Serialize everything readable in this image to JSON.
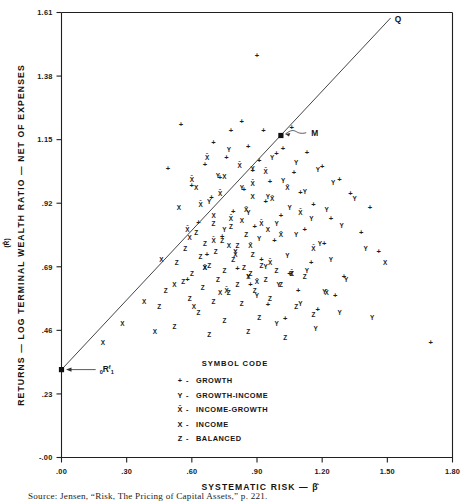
{
  "chart_data": {
    "type": "scatter",
    "title": "",
    "xlabel": "SYSTEMATIC RISK — β̂",
    "ylabel": "RETURNS — LOG TERMINAL WEALTH RATIO — NET OF EXPENSES",
    "ylabel_symbol": "(R̂)",
    "xlim": [
      0.0,
      1.8
    ],
    "ylim": [
      -0.0,
      1.61
    ],
    "xticks": [
      ".00",
      ".30",
      ".60",
      ".90",
      "1.20",
      "1.50",
      "1.80"
    ],
    "xtick_values": [
      0.0,
      0.3,
      0.6,
      0.9,
      1.2,
      1.5,
      1.8
    ],
    "yticks": [
      "1.61",
      "1.38",
      "1.15",
      ".92",
      ".69",
      ".46",
      ".23",
      "-.00"
    ],
    "ytick_values": [
      1.61,
      1.38,
      1.15,
      0.92,
      0.69,
      0.46,
      0.23,
      0.0
    ],
    "grid": false,
    "legend_position": "inside-bottom-center",
    "source": "Source: Jensen, “Risk, The Pricing of Capital Assets,” p. 221.",
    "annotations": [
      {
        "name": "Q",
        "label": "Q",
        "x": 1.52,
        "y": 1.585
      },
      {
        "name": "M",
        "label": "M",
        "x": 1.145,
        "y": 1.175
      },
      {
        "name": "Rf",
        "label": "₀Rᶠ₁",
        "x": 0.185,
        "y": 0.322
      }
    ],
    "line": {
      "name": "market-line",
      "x0": 0.0,
      "y0": 0.318,
      "x1": 1.515,
      "y1": 1.59
    },
    "markers": [
      {
        "name": "risk-free-point",
        "x": 0.0,
        "y": 0.318,
        "shape": "filled-square"
      },
      {
        "name": "market-point",
        "x": 1.01,
        "y": 1.165,
        "shape": "filled-square"
      }
    ],
    "legend": {
      "title": "SYMBOL CODE",
      "entries": [
        {
          "glyph": "+",
          "label": "GROWTH"
        },
        {
          "glyph": "Y",
          "label": "GROWTH-INCOME"
        },
        {
          "glyph": "X̄",
          "label": "INCOME-GROWTH"
        },
        {
          "glyph": "X",
          "label": "INCOME"
        },
        {
          "glyph": "Z",
          "label": "BALANCED"
        }
      ]
    },
    "series": [
      {
        "name": "GROWTH",
        "glyph": "+",
        "points": [
          [
            0.9,
            1.455
          ],
          [
            0.83,
            1.215
          ],
          [
            0.78,
            1.185
          ],
          [
            0.93,
            1.185
          ],
          [
            1.06,
            1.195
          ],
          [
            0.7,
            1.14
          ],
          [
            0.86,
            1.125
          ],
          [
            1.02,
            1.12
          ],
          [
            0.99,
            1.1
          ],
          [
            1.13,
            1.105
          ],
          [
            0.76,
            1.085
          ],
          [
            0.91,
            1.075
          ],
          [
            0.66,
            1.06
          ],
          [
            1.2,
            1.055
          ],
          [
            0.88,
            1.04
          ],
          [
            1.07,
            1.03
          ],
          [
            0.73,
            1.015
          ],
          [
            0.96,
            1.0
          ],
          [
            1.28,
            1.005
          ],
          [
            0.6,
            0.985
          ],
          [
            0.84,
            0.97
          ],
          [
            1.1,
            0.96
          ],
          [
            1.33,
            0.955
          ],
          [
            0.69,
            0.94
          ],
          [
            0.94,
            0.925
          ],
          [
            1.16,
            0.915
          ],
          [
            1.42,
            0.905
          ],
          [
            0.79,
            0.89
          ],
          [
            1.01,
            0.875
          ],
          [
            1.24,
            0.865
          ],
          [
            0.63,
            0.85
          ],
          [
            0.89,
            0.835
          ],
          [
            1.12,
            0.825
          ],
          [
            1.38,
            0.815
          ],
          [
            0.74,
            0.8
          ],
          [
            0.98,
            0.785
          ],
          [
            1.21,
            0.775
          ],
          [
            1.46,
            0.745
          ],
          [
            0.67,
            0.735
          ],
          [
            0.92,
            0.715
          ],
          [
            1.15,
            0.705
          ],
          [
            0.81,
            0.685
          ],
          [
            1.05,
            0.665
          ],
          [
            1.3,
            0.655
          ],
          [
            0.58,
            0.645
          ],
          [
            0.87,
            0.625
          ],
          [
            1.09,
            0.605
          ],
          [
            1.26,
            0.585
          ],
          [
            0.95,
            0.555
          ],
          [
            1.18,
            0.535
          ],
          [
            1.03,
            0.505
          ],
          [
            1.7,
            0.415
          ],
          [
            0.55,
            1.205
          ],
          [
            0.49,
            1.045
          ]
        ]
      },
      {
        "name": "GROWTH-INCOME",
        "glyph": "Y",
        "points": [
          [
            0.77,
            1.115
          ],
          [
            0.97,
            1.085
          ],
          [
            1.08,
            1.065
          ],
          [
            0.88,
            1.045
          ],
          [
            1.18,
            1.04
          ],
          [
            0.72,
            1.02
          ],
          [
            1.02,
            1.0
          ],
          [
            1.25,
            0.995
          ],
          [
            0.83,
            0.975
          ],
          [
            1.12,
            0.96
          ],
          [
            0.95,
            0.945
          ],
          [
            1.35,
            0.935
          ],
          [
            0.68,
            0.925
          ],
          [
            1.05,
            0.905
          ],
          [
            1.22,
            0.895
          ],
          [
            0.86,
            0.885
          ],
          [
            1.15,
            0.865
          ],
          [
            0.99,
            0.845
          ],
          [
            1.29,
            0.84
          ],
          [
            0.75,
            0.825
          ],
          [
            1.08,
            0.805
          ],
          [
            0.91,
            0.79
          ],
          [
            1.19,
            0.775
          ],
          [
            1.4,
            0.755
          ],
          [
            0.8,
            0.745
          ],
          [
            1.04,
            0.73
          ],
          [
            1.24,
            0.715
          ],
          [
            0.94,
            0.69
          ],
          [
            1.13,
            0.675
          ],
          [
            0.86,
            0.655
          ],
          [
            1.31,
            0.645
          ],
          [
            1.0,
            0.625
          ],
          [
            1.21,
            0.6
          ],
          [
            0.9,
            0.585
          ],
          [
            1.1,
            0.555
          ],
          [
            1.28,
            0.525
          ],
          [
            1.43,
            0.505
          ],
          [
            0.99,
            0.485
          ],
          [
            1.17,
            0.465
          ]
        ]
      },
      {
        "name": "INCOME-GROWTH",
        "glyph": "X̄",
        "points": [
          [
            0.67,
            1.085
          ],
          [
            0.82,
            1.055
          ],
          [
            0.94,
            1.035
          ],
          [
            0.6,
            1.005
          ],
          [
            0.88,
            0.99
          ],
          [
            1.04,
            0.975
          ],
          [
            0.73,
            0.955
          ],
          [
            0.97,
            0.935
          ],
          [
            0.64,
            0.915
          ],
          [
            0.85,
            0.895
          ],
          [
            1.1,
            0.885
          ],
          [
            0.78,
            0.865
          ],
          [
            0.92,
            0.845
          ],
          [
            0.58,
            0.825
          ],
          [
            1.01,
            0.805
          ],
          [
            0.7,
            0.785
          ],
          [
            0.87,
            0.765
          ],
          [
            1.16,
            0.755
          ],
          [
            0.8,
            0.735
          ],
          [
            0.96,
            0.705
          ],
          [
            0.66,
            0.685
          ],
          [
            1.06,
            0.665
          ],
          [
            0.9,
            0.635
          ],
          [
            0.76,
            0.605
          ],
          [
            1.22,
            0.595
          ]
        ]
      },
      {
        "name": "INCOME",
        "glyph": "X",
        "points": [
          [
            0.75,
            1.015
          ],
          [
            0.62,
            0.975
          ],
          [
            0.88,
            0.945
          ],
          [
            0.54,
            0.905
          ],
          [
            0.7,
            0.875
          ],
          [
            0.83,
            0.855
          ],
          [
            0.95,
            0.825
          ],
          [
            0.59,
            0.795
          ],
          [
            0.77,
            0.765
          ],
          [
            0.46,
            0.715
          ],
          [
            0.66,
            0.685
          ],
          [
            0.86,
            0.655
          ],
          [
            0.52,
            0.625
          ],
          [
            0.73,
            0.595
          ],
          [
            0.38,
            0.565
          ],
          [
            0.61,
            0.545
          ],
          [
            0.28,
            0.485
          ],
          [
            0.43,
            0.455
          ],
          [
            0.19,
            0.415
          ],
          [
            1.49,
            0.705
          ]
        ]
      },
      {
        "name": "BALANCED",
        "glyph": "Z",
        "points": [
          [
            0.7,
            0.845
          ],
          [
            0.78,
            0.835
          ],
          [
            0.62,
            0.815
          ],
          [
            0.85,
            0.805
          ],
          [
            0.74,
            0.785
          ],
          [
            0.66,
            0.775
          ],
          [
            0.81,
            0.765
          ],
          [
            0.57,
            0.755
          ],
          [
            0.71,
            0.745
          ],
          [
            0.88,
            0.735
          ],
          [
            0.64,
            0.725
          ],
          [
            0.79,
            0.715
          ],
          [
            0.53,
            0.705
          ],
          [
            0.68,
            0.695
          ],
          [
            0.84,
            0.685
          ],
          [
            0.92,
            0.695
          ],
          [
            0.75,
            0.675
          ],
          [
            0.6,
            0.665
          ],
          [
            0.99,
            0.675
          ],
          [
            0.87,
            0.665
          ],
          [
            1.06,
            0.665
          ],
          [
            0.72,
            0.645
          ],
          [
            0.56,
            0.635
          ],
          [
            0.94,
            0.645
          ],
          [
            1.12,
            0.655
          ],
          [
            0.81,
            0.625
          ],
          [
            0.65,
            0.615
          ],
          [
            0.48,
            0.605
          ],
          [
            1.01,
            0.625
          ],
          [
            0.77,
            0.595
          ],
          [
            0.89,
            0.605
          ],
          [
            0.59,
            0.575
          ],
          [
            0.7,
            0.565
          ],
          [
            0.96,
            0.575
          ],
          [
            0.83,
            0.555
          ],
          [
            0.45,
            0.545
          ],
          [
            1.08,
            0.545
          ],
          [
            0.63,
            0.525
          ],
          [
            0.91,
            0.505
          ],
          [
            0.75,
            0.495
          ],
          [
            1.16,
            0.515
          ],
          [
            0.52,
            0.475
          ],
          [
            0.86,
            0.455
          ],
          [
            0.68,
            0.445
          ],
          [
            1.03,
            0.435
          ]
        ]
      }
    ]
  }
}
